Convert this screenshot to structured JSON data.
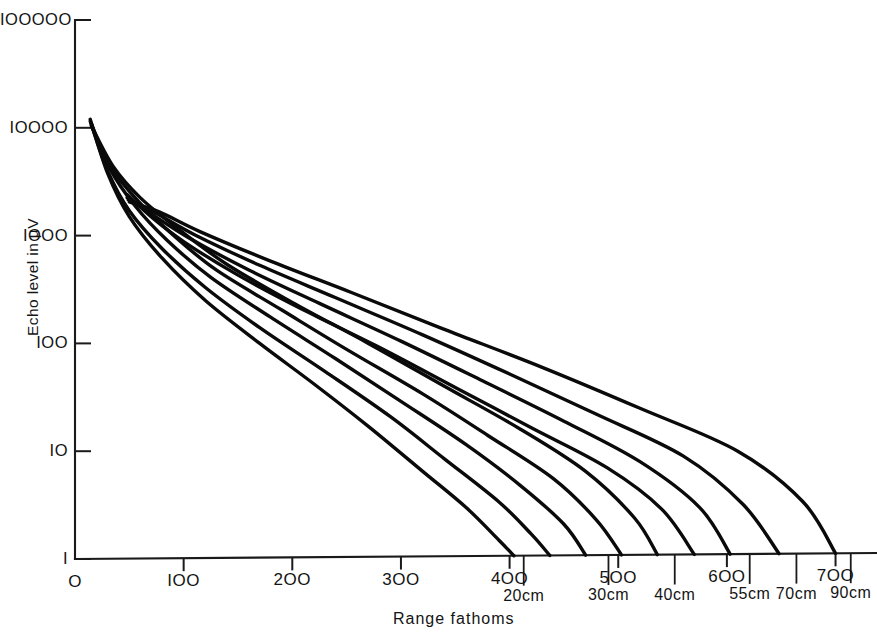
{
  "chart_data": {
    "type": "line",
    "title": "",
    "xlabel": "Range fathoms",
    "ylabel": "Echo level in µV",
    "yscale": "log",
    "xscale": "linear",
    "xlim": [
      0,
      740
    ],
    "ylim": [
      1,
      100000
    ],
    "grid": false,
    "legend": "none",
    "x_ticks": [
      {
        "value": 0,
        "label": "O"
      },
      {
        "value": 100,
        "label": "IOO"
      },
      {
        "value": 200,
        "label": "2OO"
      },
      {
        "value": 300,
        "label": "3OO"
      },
      {
        "value": 400,
        "label": "4OO"
      },
      {
        "value": 500,
        "label": "5OO"
      },
      {
        "value": 600,
        "label": "6OO"
      },
      {
        "value": 700,
        "label": "7OO"
      }
    ],
    "y_ticks": [
      {
        "value": 1,
        "label": "I"
      },
      {
        "value": 10,
        "label": "IO"
      },
      {
        "value": 100,
        "label": "IOO"
      },
      {
        "value": 1000,
        "label": "IOOO"
      },
      {
        "value": 10000,
        "label": "IOOOO"
      },
      {
        "value": 100000,
        "label": "IOOOOO"
      }
    ],
    "endpoint_annotations": [
      {
        "label": "20cm",
        "x": 413
      },
      {
        "label": "30cm",
        "x": 491
      },
      {
        "label": "40cm",
        "x": 552
      },
      {
        "label": "55cm",
        "x": 621
      },
      {
        "label": "70cm",
        "x": 664
      },
      {
        "label": "90cm",
        "x": 714
      }
    ],
    "series": [
      {
        "name": "curve-1",
        "x0": 14,
        "y0": 12000,
        "x1": 404,
        "points": [
          [
            14,
            12000
          ],
          [
            30,
            3800
          ],
          [
            50,
            1500
          ],
          [
            80,
            620
          ],
          [
            120,
            250
          ],
          [
            170,
            100
          ],
          [
            220,
            42
          ],
          [
            270,
            17
          ],
          [
            320,
            6.5
          ],
          [
            360,
            3.0
          ],
          [
            390,
            1.5
          ],
          [
            404,
            1
          ]
        ]
      },
      {
        "name": "curve-2",
        "x0": 14,
        "y0": 11500,
        "x1": 437,
        "points": [
          [
            14,
            11500
          ],
          [
            30,
            4000
          ],
          [
            50,
            1700
          ],
          [
            80,
            760
          ],
          [
            120,
            330
          ],
          [
            170,
            140
          ],
          [
            230,
            55
          ],
          [
            290,
            21
          ],
          [
            340,
            8.5
          ],
          [
            390,
            3.4
          ],
          [
            420,
            1.7
          ],
          [
            437,
            1
          ]
        ]
      },
      {
        "name": "curve-3",
        "x0": 15,
        "y0": 11000,
        "x1": 470,
        "points": [
          [
            15,
            11000
          ],
          [
            32,
            4200
          ],
          [
            55,
            1900
          ],
          [
            85,
            900
          ],
          [
            125,
            410
          ],
          [
            180,
            175
          ],
          [
            240,
            72
          ],
          [
            300,
            29
          ],
          [
            360,
            11.5
          ],
          [
            410,
            4.8
          ],
          [
            450,
            2.1
          ],
          [
            470,
            1
          ]
        ]
      },
      {
        "name": "curve-4",
        "x0": 15,
        "y0": 10500,
        "x1": 503,
        "points": [
          [
            15,
            10500
          ],
          [
            33,
            4300
          ],
          [
            58,
            2100
          ],
          [
            90,
            1020
          ],
          [
            130,
            480
          ],
          [
            190,
            205
          ],
          [
            250,
            88
          ],
          [
            320,
            34
          ],
          [
            380,
            14
          ],
          [
            440,
            5.6
          ],
          [
            480,
            2.3
          ],
          [
            503,
            1
          ]
        ]
      },
      {
        "name": "curve-5",
        "x0": 16,
        "y0": 10000,
        "x1": 536,
        "points": [
          [
            16,
            10000
          ],
          [
            35,
            4400
          ],
          [
            60,
            2250
          ],
          [
            95,
            1150
          ],
          [
            140,
            540
          ],
          [
            200,
            240
          ],
          [
            270,
            100
          ],
          [
            340,
            40
          ],
          [
            410,
            16
          ],
          [
            470,
            6.5
          ],
          [
            515,
            2.4
          ],
          [
            536,
            1
          ]
        ]
      },
      {
        "name": "curve-6",
        "x0": 48,
        "y0": 2400,
        "x1": 570,
        "points": [
          [
            48,
            2400
          ],
          [
            70,
            1500
          ],
          [
            100,
            880
          ],
          [
            150,
            430
          ],
          [
            210,
            205
          ],
          [
            280,
            92
          ],
          [
            350,
            39
          ],
          [
            420,
            16.5
          ],
          [
            490,
            7
          ],
          [
            540,
            2.9
          ],
          [
            570,
            1
          ]
        ]
      },
      {
        "name": "curve-7",
        "x0": 48,
        "y0": 2250,
        "x1": 603,
        "points": [
          [
            48,
            2250
          ],
          [
            72,
            1550
          ],
          [
            105,
            950
          ],
          [
            160,
            480
          ],
          [
            225,
            235
          ],
          [
            300,
            105
          ],
          [
            375,
            45
          ],
          [
            450,
            19
          ],
          [
            520,
            8
          ],
          [
            575,
            3.0
          ],
          [
            603,
            1
          ]
        ]
      },
      {
        "name": "curve-8",
        "x0": 49,
        "y0": 2150,
        "x1": 648,
        "points": [
          [
            49,
            2150
          ],
          [
            75,
            1600
          ],
          [
            110,
            1020
          ],
          [
            170,
            530
          ],
          [
            240,
            265
          ],
          [
            320,
            120
          ],
          [
            400,
            52
          ],
          [
            480,
            22
          ],
          [
            560,
            9
          ],
          [
            615,
            3.2
          ],
          [
            648,
            1
          ]
        ]
      },
      {
        "name": "curve-9",
        "x0": 50,
        "y0": 2050,
        "x1": 700,
        "points": [
          [
            50,
            2050
          ],
          [
            78,
            1650
          ],
          [
            115,
            1090
          ],
          [
            180,
            580
          ],
          [
            255,
            295
          ],
          [
            340,
            135
          ],
          [
            430,
            60
          ],
          [
            520,
            25
          ],
          [
            610,
            10
          ],
          [
            670,
            3.4
          ],
          [
            700,
            1
          ]
        ]
      }
    ]
  },
  "axis_titles": {
    "x": "Range fathoms",
    "y": "Echo level in µV"
  }
}
